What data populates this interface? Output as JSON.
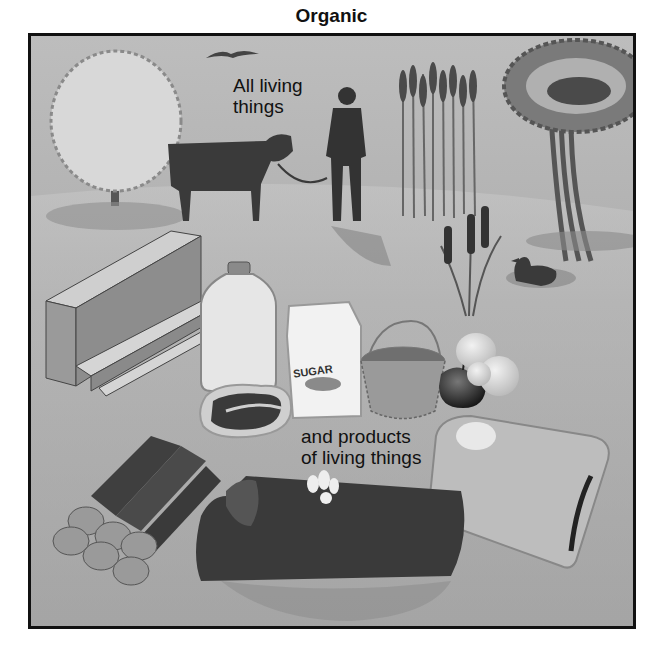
{
  "title": "Organic",
  "labels": {
    "living_line1": "All living",
    "living_line2": "things",
    "products_line1": "and products",
    "products_line2": "of living things"
  },
  "illustration": {
    "living_things": [
      "bird",
      "deciduous-tree",
      "cow",
      "man",
      "wheat",
      "palm-tree",
      "cattails",
      "duck"
    ],
    "products": [
      "lumber",
      "milk-jug",
      "sugar-bag",
      "steak",
      "basket",
      "apple",
      "pears",
      "firewood-logs",
      "rotting-log-with-mushrooms",
      "sack"
    ],
    "sugar_bag_text": "SUGAR"
  },
  "colors": {
    "frame_border": "#111111",
    "background": "#b3b3b3",
    "dark_silhouette": "#3a3a3a"
  }
}
